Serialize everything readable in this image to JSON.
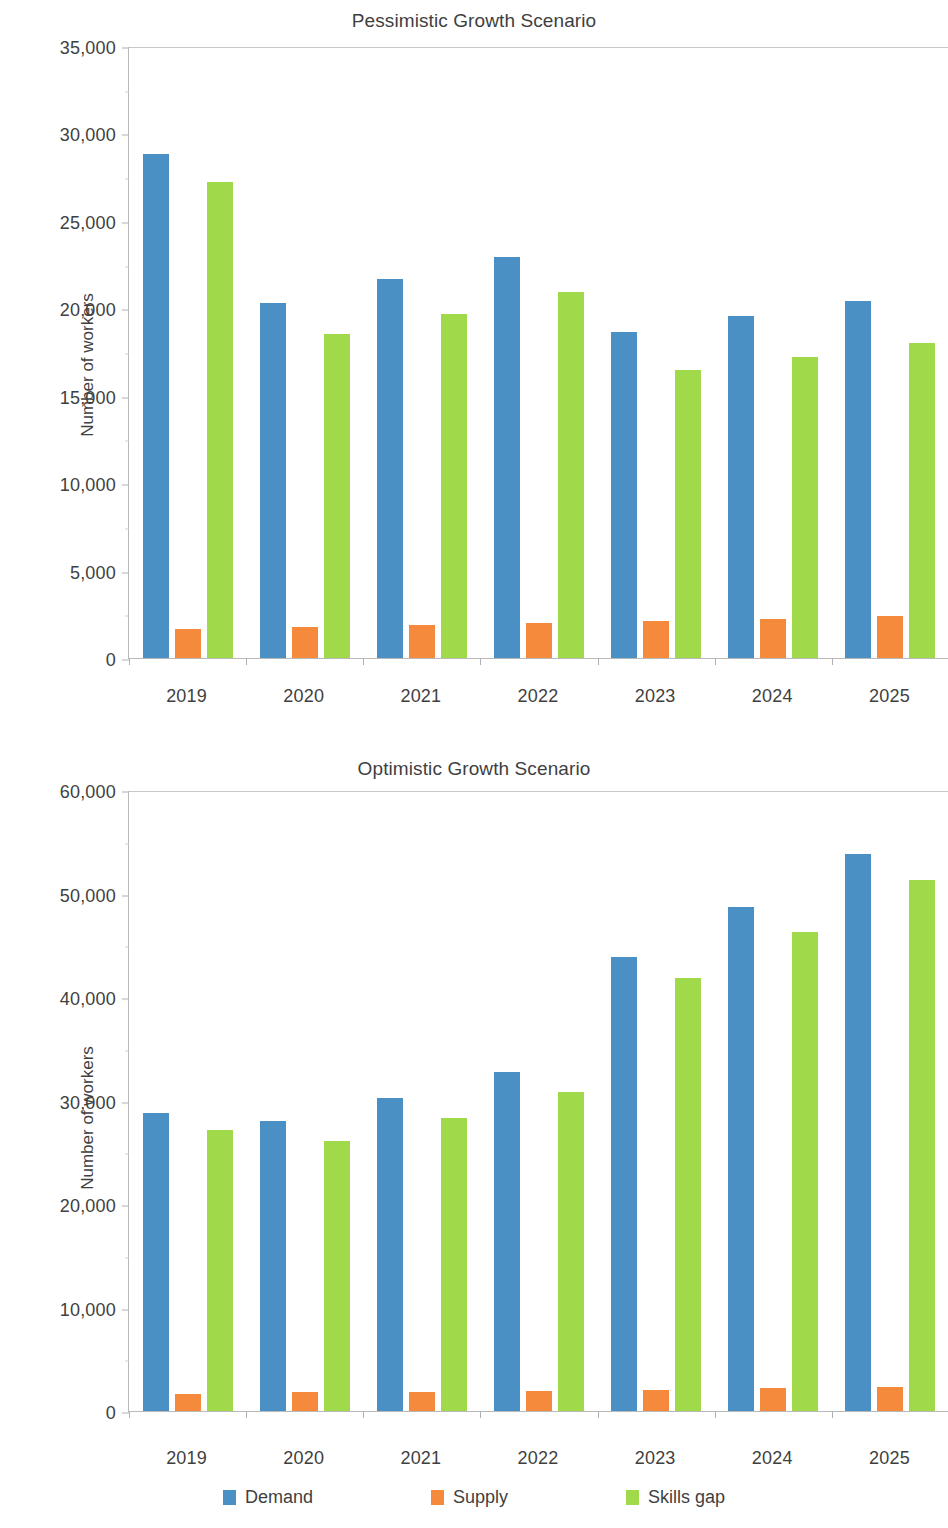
{
  "figure": {
    "y_axis_label": "Number of workers",
    "legend": [
      {
        "label": "Demand",
        "color": "#4a90c4"
      },
      {
        "label": "Supply",
        "color": "#f58a3c"
      },
      {
        "label": "Skills gap",
        "color": "#a0d94a"
      }
    ]
  },
  "chart_data": [
    {
      "type": "bar",
      "title": "Pessimistic Growth Scenario",
      "xlabel": "",
      "ylabel": "Number of workers",
      "ylim": [
        0,
        35000
      ],
      "yticks": [
        "0",
        "5,000",
        "10,000",
        "15,000",
        "20,000",
        "25,000",
        "30,000",
        "35,000"
      ],
      "ytick_values": [
        0,
        5000,
        10000,
        15000,
        20000,
        25000,
        30000,
        35000
      ],
      "grid": false,
      "legend_position": "bottom",
      "categories": [
        "2019",
        "2020",
        "2021",
        "2022",
        "2023",
        "2024",
        "2025"
      ],
      "series": [
        {
          "name": "Demand",
          "color": "#4a90c4",
          "values": [
            28800,
            20300,
            21650,
            22950,
            18650,
            19550,
            20400
          ]
        },
        {
          "name": "Supply",
          "color": "#f58a3c",
          "values": [
            1680,
            1800,
            1900,
            2020,
            2120,
            2240,
            2420
          ]
        },
        {
          "name": "Skills gap",
          "color": "#a0d94a",
          "values": [
            27200,
            18550,
            19650,
            20950,
            16500,
            17200,
            18000
          ]
        }
      ]
    },
    {
      "type": "bar",
      "title": "Optimistic Growth Scenario",
      "xlabel": "",
      "ylabel": "Number of workers",
      "ylim": [
        0,
        60000
      ],
      "yticks": [
        "0",
        "10,000",
        "20,000",
        "30,000",
        "40,000",
        "50,000",
        "60,000"
      ],
      "ytick_values": [
        0,
        10000,
        20000,
        30000,
        40000,
        50000,
        60000
      ],
      "grid": false,
      "legend_position": "bottom",
      "categories": [
        "2019",
        "2020",
        "2021",
        "2022",
        "2023",
        "2024",
        "2025"
      ],
      "series": [
        {
          "name": "Demand",
          "color": "#4a90c4",
          "values": [
            28800,
            28000,
            30200,
            32800,
            43900,
            48700,
            53800
          ]
        },
        {
          "name": "Supply",
          "color": "#f58a3c",
          "values": [
            1680,
            1820,
            1880,
            1980,
            2020,
            2180,
            2320
          ]
        },
        {
          "name": "Skills gap",
          "color": "#a0d94a",
          "values": [
            27150,
            26050,
            28350,
            30800,
            41800,
            46300,
            51300
          ]
        }
      ]
    }
  ]
}
